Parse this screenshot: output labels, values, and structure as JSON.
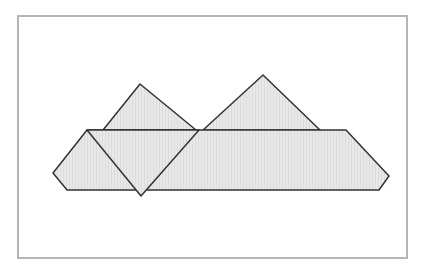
{
  "diagram": {
    "colors": {
      "fill": "#e6e6e6",
      "stroke": "#333333",
      "frame": "#b5b5b5",
      "background": "#ffffff"
    },
    "frame": {
      "x": 18,
      "y": 16,
      "width": 175,
      "height": 242
    },
    "shapes": [
      {
        "name": "left-up-triangle",
        "points": "103,130 140,84 196,130"
      },
      {
        "name": "right-up-triangle",
        "points": "203,130 263,75 320,130"
      },
      {
        "name": "band",
        "points": "87,130 346,130 389,176 379,190 67,190 53,173"
      },
      {
        "name": "down-triangle",
        "points": "87,130 199,130 141,196"
      }
    ]
  }
}
